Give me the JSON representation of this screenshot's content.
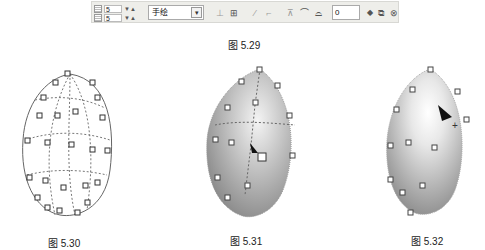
{
  "toolbar": {
    "spinner_rows": {
      "value": "5"
    },
    "spinner_cols": {
      "value": "5"
    },
    "mode_select": {
      "value": "手绘"
    },
    "icons": [
      "node-add-icon",
      "node-join-icon",
      "line-icon",
      "curve-icon",
      "segment-icon",
      "smooth-icon",
      "symmetric-icon"
    ],
    "number_field": {
      "value": "0"
    },
    "right_icons": [
      "copy-mesh-icon",
      "reset-mesh-icon"
    ]
  },
  "captions": {
    "fig_529": "图 5.29",
    "fig_530": "图 5.30",
    "fig_531": "图 5.31",
    "fig_532": "图 5.32"
  },
  "colors": {
    "toolbar_bg": "#eeeeea",
    "mesh_line": "#555555",
    "fill_light": "#f4f4f4",
    "fill_dark": "#9a9a9a"
  }
}
